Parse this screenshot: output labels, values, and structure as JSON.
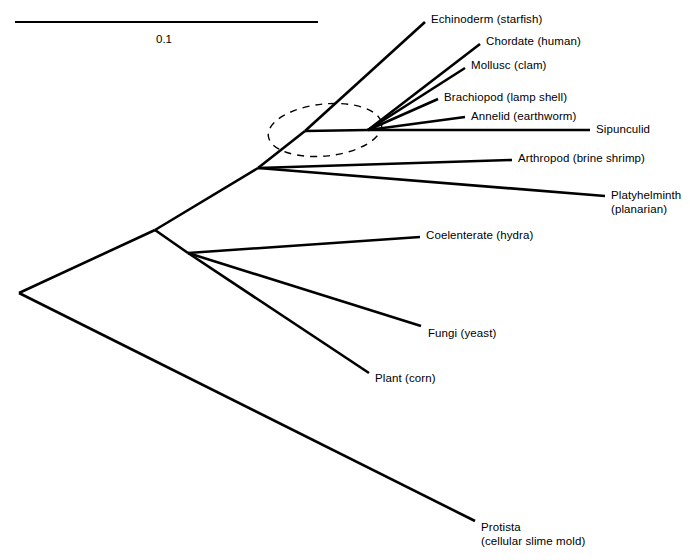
{
  "figure": {
    "kind": "phylogenetic-tree",
    "background_color": "#ffffff",
    "line_color": "#000000"
  },
  "scale_bar": {
    "label": "0.1",
    "x1": 15,
    "x2": 318,
    "y": 22,
    "label_x": 167,
    "label_y": 33
  },
  "nodes": {
    "root": {
      "x": 19,
      "y": 293
    },
    "node_eukaryote_split": {
      "x": 155,
      "y": 230
    },
    "node_plant_fungi_coelenterate": {
      "x": 188,
      "y": 253
    },
    "node_bilateria": {
      "x": 258,
      "y": 168
    },
    "node_echinoderm_branchpoint": {
      "x": 305,
      "y": 131
    },
    "node_polytomy": {
      "x": 368,
      "y": 130
    }
  },
  "highlight": {
    "name": "polytomy-highlight-ellipse",
    "cx": 325,
    "cy": 130,
    "rx": 57,
    "ry": 26,
    "rotation": -6,
    "dash": "7 6"
  },
  "tips": [
    {
      "id": "echinoderm",
      "lines": [
        "Echinoderm (starfish)"
      ],
      "from": {
        "x": 305,
        "y": 131
      },
      "to": {
        "x": 425,
        "y": 22
      },
      "label_x": 431,
      "label_y": 13
    },
    {
      "id": "chordate",
      "lines": [
        "Chordate (human)"
      ],
      "from": {
        "x": 368,
        "y": 130
      },
      "to": {
        "x": 480,
        "y": 44
      },
      "label_x": 486,
      "label_y": 35
    },
    {
      "id": "mollusc",
      "lines": [
        "Mollusc (clam)"
      ],
      "from": {
        "x": 368,
        "y": 130
      },
      "to": {
        "x": 465,
        "y": 68
      },
      "label_x": 471,
      "label_y": 59
    },
    {
      "id": "brachiopod",
      "lines": [
        "Brachiopod (lamp shell)"
      ],
      "from": {
        "x": 368,
        "y": 130
      },
      "to": {
        "x": 438,
        "y": 99
      },
      "label_x": 444,
      "label_y": 91
    },
    {
      "id": "annelid",
      "lines": [
        "Annelid (earthworm)"
      ],
      "from": {
        "x": 368,
        "y": 130
      },
      "to": {
        "x": 465,
        "y": 117
      },
      "label_x": 471,
      "label_y": 110
    },
    {
      "id": "sipunculid",
      "lines": [
        "Sipunculid"
      ],
      "from": {
        "x": 368,
        "y": 130
      },
      "to": {
        "x": 590,
        "y": 130
      },
      "label_x": 596,
      "label_y": 123
    },
    {
      "id": "arthropod",
      "lines": [
        "Arthropod (brine shrimp)"
      ],
      "from": {
        "x": 258,
        "y": 168
      },
      "to": {
        "x": 512,
        "y": 160
      },
      "label_x": 518,
      "label_y": 152
    },
    {
      "id": "platyhelminth",
      "lines": [
        "Platyhelminth",
        "(planarian)"
      ],
      "from": {
        "x": 258,
        "y": 168
      },
      "to": {
        "x": 605,
        "y": 196
      },
      "label_x": 611,
      "label_y": 189
    },
    {
      "id": "coelenterate",
      "lines": [
        "Coelenterate (hydra)"
      ],
      "from": {
        "x": 188,
        "y": 253
      },
      "to": {
        "x": 420,
        "y": 237
      },
      "label_x": 426,
      "label_y": 229
    },
    {
      "id": "fungi",
      "lines": [
        "Fungi (yeast)"
      ],
      "from": {
        "x": 188,
        "y": 253
      },
      "to": {
        "x": 421,
        "y": 326
      },
      "label_x": 428,
      "label_y": 327
    },
    {
      "id": "plant",
      "lines": [
        "Plant (corn)"
      ],
      "from": {
        "x": 188,
        "y": 253
      },
      "to": {
        "x": 369,
        "y": 373
      },
      "label_x": 375,
      "label_y": 372
    },
    {
      "id": "protista",
      "lines": [
        "Protista",
        "(cellular slime mold)"
      ],
      "from": {
        "x": 19,
        "y": 293
      },
      "to": {
        "x": 475,
        "y": 521
      },
      "label_x": 481,
      "label_y": 521
    }
  ],
  "internal_branches": [
    {
      "id": "root-to-eukaryote-split",
      "from": {
        "x": 19,
        "y": 293
      },
      "to": {
        "x": 155,
        "y": 230
      }
    },
    {
      "id": "eukaryote-split-to-bilateria",
      "from": {
        "x": 155,
        "y": 230
      },
      "to": {
        "x": 258,
        "y": 168
      }
    },
    {
      "id": "eukaryote-split-to-plant-fungi-node",
      "from": {
        "x": 155,
        "y": 230
      },
      "to": {
        "x": 188,
        "y": 253
      }
    },
    {
      "id": "bilateria-to-echinoderm-branchpoint",
      "from": {
        "x": 258,
        "y": 168
      },
      "to": {
        "x": 305,
        "y": 131
      }
    },
    {
      "id": "echinoderm-branchpoint-to-polytomy",
      "from": {
        "x": 305,
        "y": 131
      },
      "to": {
        "x": 368,
        "y": 130
      }
    }
  ]
}
